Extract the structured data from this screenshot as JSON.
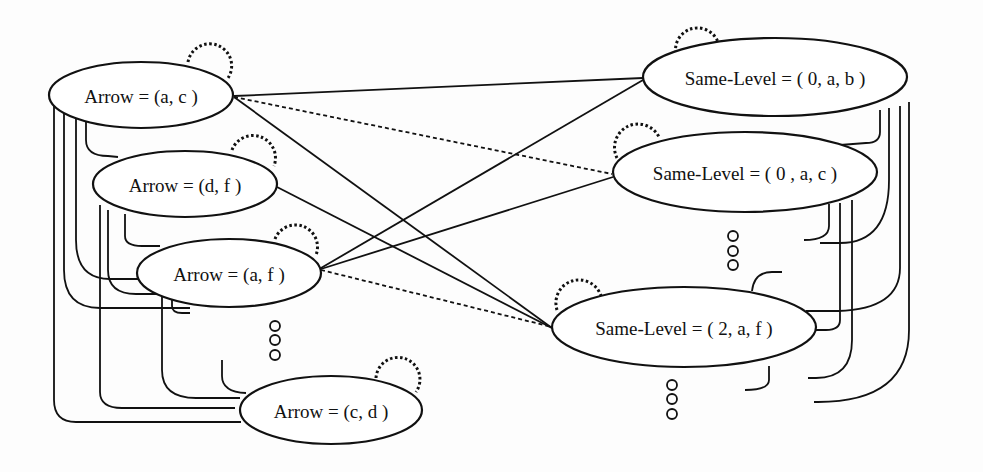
{
  "diagram": {
    "type": "graph",
    "colors": {
      "stroke": "#111111",
      "background": "#fdfdfd",
      "node_fill": "#ffffff"
    },
    "left_nodes": [
      {
        "id": "arrow-a-c",
        "label": "Arrow = (a, c )"
      },
      {
        "id": "arrow-d-f",
        "label": "Arrow = (d, f )"
      },
      {
        "id": "arrow-a-f",
        "label": "Arrow = (a, f )"
      },
      {
        "id": "arrow-c-d",
        "label": "Arrow = (c, d )"
      }
    ],
    "right_nodes": [
      {
        "id": "same-level-0-a-b",
        "label": "Same-Level = ( 0, a, b )"
      },
      {
        "id": "same-level-0-a-c",
        "label": "Same-Level = ( 0 , a, c )"
      },
      {
        "id": "same-level-2-a-f",
        "label": "Same-Level = ( 2, a, f )"
      }
    ],
    "edges": [
      {
        "from": "arrow-a-c",
        "to": "same-level-0-a-b",
        "style": "solid"
      },
      {
        "from": "arrow-a-c",
        "to": "same-level-0-a-c",
        "style": "dashed"
      },
      {
        "from": "arrow-a-c",
        "to": "same-level-2-a-f",
        "style": "solid"
      },
      {
        "from": "arrow-d-f",
        "to": "same-level-2-a-f",
        "style": "solid"
      },
      {
        "from": "arrow-a-f",
        "to": "same-level-0-a-b",
        "style": "solid"
      },
      {
        "from": "arrow-a-f",
        "to": "same-level-0-a-c",
        "style": "solid"
      },
      {
        "from": "arrow-a-f",
        "to": "same-level-2-a-f",
        "style": "dashed"
      }
    ],
    "self_loops": [
      "arrow-a-c",
      "arrow-d-f",
      "arrow-a-f",
      "arrow-c-d",
      "same-level-0-a-b",
      "same-level-0-a-c",
      "same-level-2-a-f"
    ],
    "ellipsis_markers": [
      {
        "position": "between arrow-a-f and arrow-c-d",
        "glyph": "ooo"
      },
      {
        "position": "between same-level-0-a-c and same-level-2-a-f",
        "glyph": "ooo"
      },
      {
        "position": "below same-level-2-a-f",
        "glyph": "ooo"
      }
    ]
  }
}
